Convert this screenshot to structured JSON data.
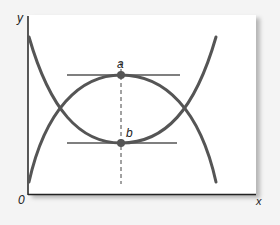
{
  "figure": {
    "axis_labels": {
      "y": "y",
      "x": "x",
      "origin": "0"
    },
    "points": [
      {
        "label": "a",
        "description": "maximum of inverted-U curve",
        "x": 121,
        "y": 75
      },
      {
        "label": "b",
        "description": "minimum of U curve",
        "x": 121,
        "y": 143
      }
    ],
    "curves": [
      {
        "name": "U-shaped curve",
        "shape": "convex, minimum at b"
      },
      {
        "name": "inverted-U curve",
        "shape": "concave, maximum at a"
      }
    ],
    "annotations": {
      "tangent_lines": [
        "horizontal tangent at a",
        "horizontal tangent at b"
      ],
      "vertical_dashed_line": "through a and b"
    },
    "colors": {
      "curve": "#555555",
      "axis": "#222222",
      "background": "#ffffff"
    }
  }
}
